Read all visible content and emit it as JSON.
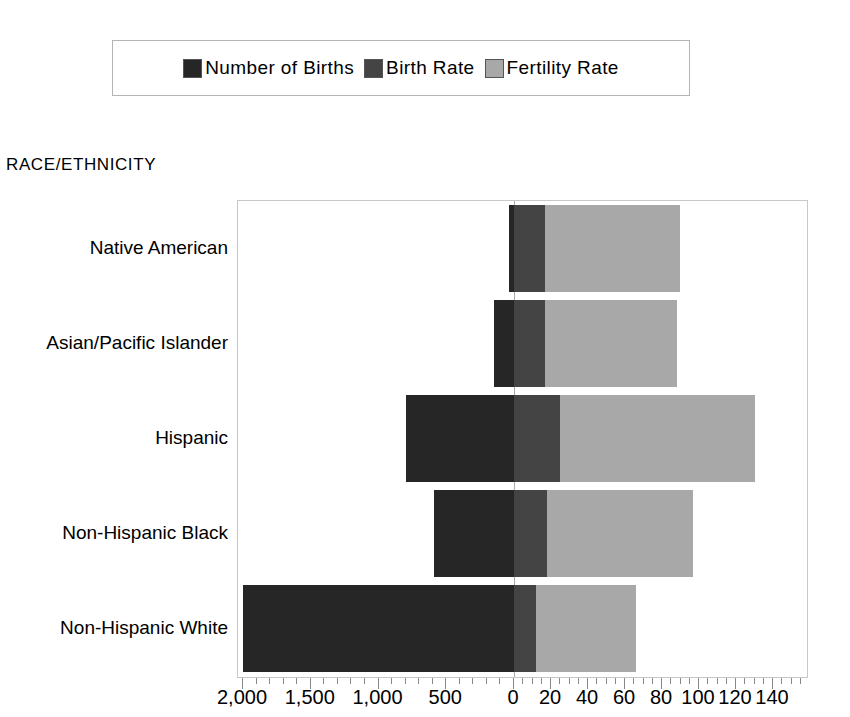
{
  "legend": {
    "position": "top",
    "entries": [
      {
        "label": "Number of Births",
        "color": "#262626",
        "key": "births"
      },
      {
        "label": "Birth Rate",
        "color": "#444444",
        "key": "birth_rate"
      },
      {
        "label": "Fertility Rate",
        "color": "#a8a8a8",
        "key": "fertility_rate"
      }
    ]
  },
  "axis_title": "RACE/ETHNICITY",
  "chart_data": {
    "type": "bar",
    "orientation": "horizontal",
    "stacked": true,
    "title": "",
    "subtitle": "",
    "xlabel": "",
    "ylabel": "RACE/ETHNICITY",
    "grid": false,
    "legend_position": "top",
    "categories": [
      "Native American",
      "Asian/Pacific Islander",
      "Hispanic",
      "Non-Hispanic Black",
      "Non-Hispanic White"
    ],
    "series": [
      {
        "name": "Number of Births",
        "color": "#262626",
        "axis": "left",
        "unit": "thousands",
        "direction": "left",
        "values": [
          40,
          150,
          800,
          590,
          2000
        ]
      },
      {
        "name": "Birth Rate",
        "color": "#444444",
        "axis": "right",
        "unit": "per 1,000 population",
        "direction": "right",
        "values": [
          17,
          17,
          25,
          18,
          12
        ]
      },
      {
        "name": "Fertility Rate",
        "color": "#a8a8a8",
        "axis": "right",
        "unit": "per 1,000 women aged 15-44",
        "direction": "right",
        "values": [
          90,
          88,
          130,
          97,
          66
        ]
      }
    ],
    "left_axis": {
      "name": "Number of Births",
      "ticks": [
        2000,
        1500,
        1000,
        500,
        0
      ],
      "tick_labels": [
        "2,000",
        "1,500",
        "1,000",
        "500",
        "0"
      ],
      "min": 0,
      "max": 2200,
      "reversed": true
    },
    "right_axis": {
      "name": "Rate",
      "ticks": [
        0,
        20,
        40,
        60,
        80,
        100,
        120,
        140
      ],
      "tick_labels": [
        "0",
        "20",
        "40",
        "60",
        "80",
        "100",
        "120",
        "140"
      ],
      "min": 0,
      "max": 160
    }
  },
  "geometry": {
    "zero_x_px": 513,
    "plot_left_px": 237,
    "plot_right_px": 808,
    "plot_top_px": 200,
    "plot_bottom_px": 678,
    "px_per_rate_unit": 1.85,
    "px_per_birth_thousand": 0.1355,
    "bar_height_px": 87,
    "row_pitch_px": 95,
    "first_row_top_px": 204
  },
  "tick_marks": {
    "left_major_values": [
      2000,
      1500,
      1000,
      500
    ],
    "left_minor_step": 100,
    "right_major_values": [
      20,
      40,
      60,
      80,
      100,
      120,
      140
    ],
    "right_minor_step": 5
  }
}
